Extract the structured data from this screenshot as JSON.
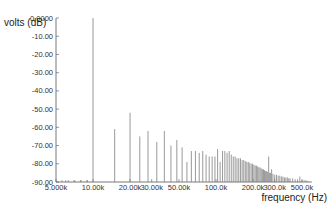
{
  "chart_data": {
    "type": "bar",
    "title": "",
    "xlabel": "frequency (Hz)",
    "ylabel": "volts (dB)",
    "xscale": "log",
    "xlim": [
      5000,
      600000
    ],
    "ylim": [
      -90,
      0
    ],
    "grid": false,
    "legend": null,
    "y_ticks": [
      "0.0000",
      "-10.00",
      "-20.00",
      "-30.00",
      "-40.00",
      "-50.00",
      "-60.00",
      "-70.00",
      "-80.00",
      "-90.00"
    ],
    "x_ticks": [
      {
        "value": 5000,
        "label": "5.000k"
      },
      {
        "value": 10000,
        "label": "10.00k"
      },
      {
        "value": 20000,
        "label": "20.00k"
      },
      {
        "value": 30000,
        "label": "30.00k"
      },
      {
        "value": 50000,
        "label": "50.00k"
      },
      {
        "value": 100000,
        "label": "100.0k"
      },
      {
        "value": 200000,
        "label": "200.0k"
      },
      {
        "value": 300000,
        "label": "300.0k"
      },
      {
        "value": 500000,
        "label": "500.0k"
      }
    ],
    "series": [
      {
        "name": "spectrum",
        "points": [
          {
            "x": 5600,
            "y": -89
          },
          {
            "x": 6300,
            "y": -89
          },
          {
            "x": 7100,
            "y": -89
          },
          {
            "x": 7900,
            "y": -89
          },
          {
            "x": 8900,
            "y": -89
          },
          {
            "x": 10000,
            "y": 0
          },
          {
            "x": 15000,
            "y": -61
          },
          {
            "x": 20000,
            "y": -52
          },
          {
            "x": 24000,
            "y": -65
          },
          {
            "x": 28000,
            "y": -62
          },
          {
            "x": 33000,
            "y": -68
          },
          {
            "x": 38000,
            "y": -62
          },
          {
            "x": 43000,
            "y": -70
          },
          {
            "x": 48000,
            "y": -67
          },
          {
            "x": 53000,
            "y": -71
          },
          {
            "x": 58000,
            "y": -79
          },
          {
            "x": 63000,
            "y": -73
          },
          {
            "x": 68000,
            "y": -73
          },
          {
            "x": 73000,
            "y": -74
          },
          {
            "x": 78000,
            "y": -73
          },
          {
            "x": 83000,
            "y": -75
          },
          {
            "x": 88000,
            "y": -76
          },
          {
            "x": 93000,
            "y": -76
          },
          {
            "x": 98000,
            "y": -76
          },
          {
            "x": 103000,
            "y": -72
          },
          {
            "x": 108000,
            "y": -79
          },
          {
            "x": 113000,
            "y": -73
          },
          {
            "x": 118000,
            "y": -73
          },
          {
            "x": 123000,
            "y": -74
          },
          {
            "x": 128000,
            "y": -73
          },
          {
            "x": 133000,
            "y": -75
          },
          {
            "x": 138000,
            "y": -76
          },
          {
            "x": 143000,
            "y": -76
          },
          {
            "x": 148000,
            "y": -77
          },
          {
            "x": 153000,
            "y": -77
          },
          {
            "x": 158000,
            "y": -77
          },
          {
            "x": 163000,
            "y": -78
          },
          {
            "x": 168000,
            "y": -78
          },
          {
            "x": 173000,
            "y": -78.5
          },
          {
            "x": 178000,
            "y": -79
          },
          {
            "x": 183000,
            "y": -79
          },
          {
            "x": 188000,
            "y": -79.5
          },
          {
            "x": 193000,
            "y": -80
          },
          {
            "x": 198000,
            "y": -80
          },
          {
            "x": 203000,
            "y": -80.5
          },
          {
            "x": 208000,
            "y": -81
          },
          {
            "x": 213000,
            "y": -81
          },
          {
            "x": 218000,
            "y": -81.5
          },
          {
            "x": 223000,
            "y": -82
          },
          {
            "x": 228000,
            "y": -82
          },
          {
            "x": 233000,
            "y": -82.5
          },
          {
            "x": 238000,
            "y": -83
          },
          {
            "x": 243000,
            "y": -83
          },
          {
            "x": 248000,
            "y": -83.5
          },
          {
            "x": 253000,
            "y": -84
          },
          {
            "x": 258000,
            "y": -84
          },
          {
            "x": 263000,
            "y": -84.5
          },
          {
            "x": 268000,
            "y": -76
          },
          {
            "x": 273000,
            "y": -85
          },
          {
            "x": 278000,
            "y": -85
          },
          {
            "x": 283000,
            "y": -83
          },
          {
            "x": 290000,
            "y": -85.5
          },
          {
            "x": 300000,
            "y": -86
          },
          {
            "x": 310000,
            "y": -86
          },
          {
            "x": 320000,
            "y": -86.5
          },
          {
            "x": 330000,
            "y": -86.5
          },
          {
            "x": 340000,
            "y": -87
          },
          {
            "x": 350000,
            "y": -87
          },
          {
            "x": 360000,
            "y": -87.5
          },
          {
            "x": 370000,
            "y": -87.5
          },
          {
            "x": 380000,
            "y": -87.5
          },
          {
            "x": 390000,
            "y": -88
          },
          {
            "x": 400000,
            "y": -88
          },
          {
            "x": 420000,
            "y": -88
          },
          {
            "x": 440000,
            "y": -88.5
          },
          {
            "x": 460000,
            "y": -88.5
          },
          {
            "x": 480000,
            "y": -87
          },
          {
            "x": 500000,
            "y": -89
          },
          {
            "x": 520000,
            "y": -89
          },
          {
            "x": 540000,
            "y": -89
          },
          {
            "x": 560000,
            "y": -89.5
          }
        ]
      }
    ]
  },
  "colors": {
    "bar": "#7f7f7f",
    "axis": "#555555",
    "text": "#333333"
  }
}
